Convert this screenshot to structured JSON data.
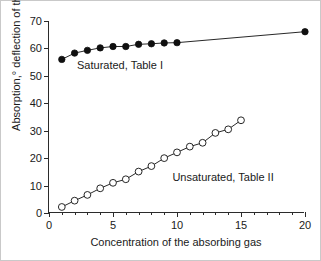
{
  "chart_data": {
    "type": "scatter",
    "title": "",
    "xlabel": "Concentration of the absorbing gas",
    "ylabel": "Absorption,° deflection of the sensor",
    "xlim": [
      0,
      20
    ],
    "ylim": [
      0,
      70
    ],
    "xticks": [
      0,
      5,
      10,
      15,
      20
    ],
    "xticklabels": [
      "0",
      "5",
      "10",
      "15",
      "20"
    ],
    "xminorticks": [
      1,
      2,
      3,
      4,
      6,
      7,
      8,
      9,
      11,
      12,
      13,
      14,
      16,
      17,
      18,
      19
    ],
    "yticks": [
      0,
      10,
      20,
      30,
      40,
      50,
      60,
      70
    ],
    "yticklabels": [
      "0",
      "10",
      "20",
      "30",
      "40",
      "50",
      "60",
      "70"
    ],
    "grid": false,
    "legend_position": "inline-annotation",
    "series": [
      {
        "name": "Saturated, Table I",
        "marker": "filled-circle",
        "color": "#101010",
        "line": true,
        "x": [
          1,
          2,
          3,
          4,
          5,
          6,
          7,
          8,
          9,
          10,
          20
        ],
        "y": [
          56.0,
          58.3,
          59.3,
          60.2,
          60.7,
          60.7,
          61.5,
          61.7,
          62.0,
          62.1,
          66.1
        ]
      },
      {
        "name": "Unsaturated, Table II",
        "marker": "open-circle",
        "color": "#101010",
        "line": true,
        "x": [
          1,
          2,
          3,
          4,
          5,
          6,
          7,
          8,
          9,
          10,
          11,
          12,
          13,
          14,
          15
        ],
        "y": [
          2.2,
          4.5,
          6.6,
          9.0,
          11.0,
          12.3,
          15.1,
          17.1,
          20.0,
          22.1,
          24.2,
          25.6,
          29.2,
          30.5,
          33.8
        ]
      }
    ],
    "annotations": [
      {
        "text": "Saturated, Table I",
        "x": 5.55,
        "y": 54.0
      },
      {
        "text": "Unsaturated, Table II",
        "x": 13.6,
        "y": 13.2
      }
    ]
  }
}
